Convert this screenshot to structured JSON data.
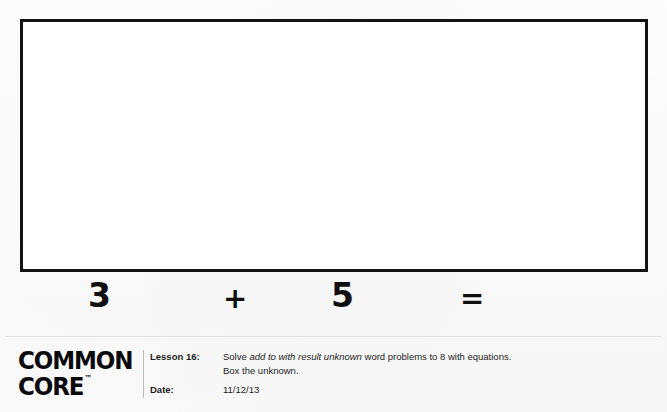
{
  "document": {
    "type": "worksheet",
    "answer_box": {
      "name": "blank-answer-box",
      "content": ""
    },
    "equation": {
      "addend_1": "3",
      "operator": "+",
      "addend_2": "5",
      "equals": "=",
      "sum": ""
    }
  },
  "footer": {
    "logo": {
      "line1": "COMMON",
      "line2": "CORE",
      "trademark": "™"
    },
    "lesson": {
      "label": "Lesson 16:",
      "description_part1": "Solve ",
      "description_italic": "add to with result unknown",
      "description_part2": " word problems to 8 with equations.",
      "description_line2": "Box the unknown."
    },
    "date": {
      "label": "Date:",
      "value": "11/12/13"
    }
  }
}
